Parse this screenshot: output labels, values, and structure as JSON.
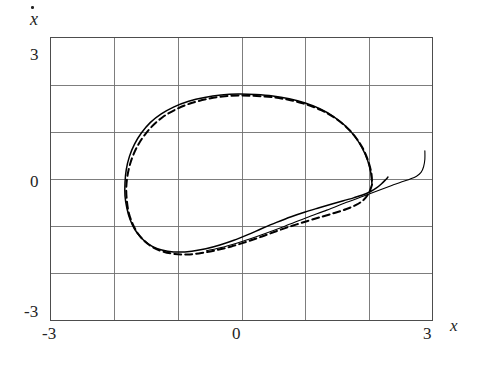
{
  "figure": {
    "kind": "phase-plane-plot",
    "background_color": "#ffffff",
    "frame_color": "#555555",
    "grid_color": "#777777",
    "curve_color": "#000000"
  },
  "axes": {
    "x": {
      "name": "x",
      "label_glyph": "x",
      "min": -3,
      "max": 3,
      "tick_labels": [
        "-3",
        "0",
        "3"
      ],
      "tick_values": [
        -3,
        0,
        3
      ],
      "gridline_values": [
        -3,
        -2,
        -1,
        0,
        1,
        2,
        3
      ]
    },
    "y": {
      "name": "xdot",
      "label_glyph": "x",
      "min": -3,
      "max": 3,
      "tick_labels": [
        "3",
        "0",
        "-3"
      ],
      "tick_values": [
        3,
        0,
        -3
      ],
      "gridline_values": [
        -3,
        -2,
        -1,
        0,
        1,
        2,
        3
      ]
    }
  },
  "chart_data": {
    "type": "line",
    "title": "",
    "xlabel": "x",
    "ylabel": "xdot",
    "xlim": [
      -3,
      3
    ],
    "ylim": [
      -3,
      3
    ],
    "grid": true,
    "legend": "none",
    "series": [
      {
        "name": "solid-trajectory",
        "style": "solid",
        "color": "#000000",
        "points": [
          [
            2.3,
            0.04
          ],
          [
            2.26,
            -0.02
          ],
          [
            2.2,
            -0.1
          ],
          [
            2.12,
            -0.19
          ],
          [
            2.02,
            -0.27
          ],
          [
            1.9,
            -0.34
          ],
          [
            1.76,
            -0.4
          ],
          [
            1.6,
            -0.46
          ],
          [
            1.42,
            -0.53
          ],
          [
            1.22,
            -0.61
          ],
          [
            1.0,
            -0.7
          ],
          [
            0.78,
            -0.8
          ],
          [
            0.55,
            -0.92
          ],
          [
            0.32,
            -1.05
          ],
          [
            0.1,
            -1.18
          ],
          [
            -0.12,
            -1.3
          ],
          [
            -0.34,
            -1.4
          ],
          [
            -0.56,
            -1.48
          ],
          [
            -0.78,
            -1.53
          ],
          [
            -0.98,
            -1.55
          ],
          [
            -1.16,
            -1.53
          ],
          [
            -1.32,
            -1.48
          ],
          [
            -1.46,
            -1.38
          ],
          [
            -1.58,
            -1.24
          ],
          [
            -1.68,
            -1.06
          ],
          [
            -1.75,
            -0.86
          ],
          [
            -1.8,
            -0.62
          ],
          [
            -1.83,
            -0.36
          ],
          [
            -1.83,
            -0.08
          ],
          [
            -1.81,
            0.2
          ],
          [
            -1.76,
            0.48
          ],
          [
            -1.68,
            0.74
          ],
          [
            -1.57,
            0.98
          ],
          [
            -1.43,
            1.2
          ],
          [
            -1.26,
            1.38
          ],
          [
            -1.06,
            1.53
          ],
          [
            -0.83,
            1.65
          ],
          [
            -0.58,
            1.73
          ],
          [
            -0.32,
            1.78
          ],
          [
            -0.05,
            1.8
          ],
          [
            0.22,
            1.79
          ],
          [
            0.49,
            1.76
          ],
          [
            0.75,
            1.7
          ],
          [
            1.0,
            1.61
          ],
          [
            1.23,
            1.49
          ],
          [
            1.44,
            1.33
          ],
          [
            1.62,
            1.14
          ],
          [
            1.77,
            0.92
          ],
          [
            1.89,
            0.67
          ],
          [
            1.98,
            0.4
          ],
          [
            2.03,
            0.14
          ],
          [
            2.05,
            -0.12
          ]
        ]
      },
      {
        "name": "dashed-trajectory",
        "style": "dashed",
        "color": "#000000",
        "points": [
          [
            2.05,
            -0.12
          ],
          [
            2.0,
            -0.3
          ],
          [
            1.92,
            -0.44
          ],
          [
            1.8,
            -0.55
          ],
          [
            1.64,
            -0.64
          ],
          [
            1.46,
            -0.72
          ],
          [
            1.26,
            -0.8
          ],
          [
            1.04,
            -0.89
          ],
          [
            0.8,
            -0.99
          ],
          [
            0.56,
            -1.1
          ],
          [
            0.32,
            -1.22
          ],
          [
            0.08,
            -1.33
          ],
          [
            -0.16,
            -1.43
          ],
          [
            -0.4,
            -1.51
          ],
          [
            -0.63,
            -1.57
          ],
          [
            -0.85,
            -1.6
          ],
          [
            -1.05,
            -1.59
          ],
          [
            -1.23,
            -1.54
          ],
          [
            -1.39,
            -1.45
          ],
          [
            -1.52,
            -1.32
          ],
          [
            -1.63,
            -1.15
          ],
          [
            -1.71,
            -0.95
          ],
          [
            -1.77,
            -0.72
          ],
          [
            -1.8,
            -0.47
          ],
          [
            -1.81,
            -0.2
          ],
          [
            -1.79,
            0.08
          ],
          [
            -1.74,
            0.36
          ],
          [
            -1.66,
            0.63
          ],
          [
            -1.55,
            0.88
          ],
          [
            -1.41,
            1.11
          ],
          [
            -1.24,
            1.31
          ],
          [
            -1.04,
            1.47
          ],
          [
            -0.81,
            1.6
          ],
          [
            -0.56,
            1.69
          ],
          [
            -0.3,
            1.75
          ],
          [
            -0.03,
            1.77
          ],
          [
            0.24,
            1.76
          ],
          [
            0.51,
            1.73
          ],
          [
            0.77,
            1.67
          ],
          [
            1.02,
            1.58
          ],
          [
            1.25,
            1.46
          ],
          [
            1.46,
            1.3
          ],
          [
            1.64,
            1.11
          ],
          [
            1.79,
            0.89
          ],
          [
            1.91,
            0.64
          ],
          [
            1.99,
            0.38
          ],
          [
            2.04,
            0.12
          ],
          [
            2.05,
            -0.12
          ]
        ]
      },
      {
        "name": "transient-tail",
        "style": "solid",
        "color": "#000000",
        "points": [
          [
            2.88,
            0.6
          ],
          [
            2.88,
            0.42
          ],
          [
            2.86,
            0.26
          ],
          [
            2.82,
            0.14
          ],
          [
            2.75,
            0.06
          ],
          [
            2.65,
            0.0
          ],
          [
            2.52,
            -0.06
          ],
          [
            2.36,
            -0.14
          ],
          [
            2.16,
            -0.24
          ],
          [
            1.92,
            -0.36
          ],
          [
            1.64,
            -0.5
          ],
          [
            1.34,
            -0.66
          ],
          [
            1.02,
            -0.82
          ],
          [
            0.68,
            -1.0
          ],
          [
            0.34,
            -1.17
          ],
          [
            0.02,
            -1.32
          ],
          [
            -0.28,
            -1.44
          ],
          [
            -0.55,
            -1.52
          ]
        ]
      }
    ]
  }
}
